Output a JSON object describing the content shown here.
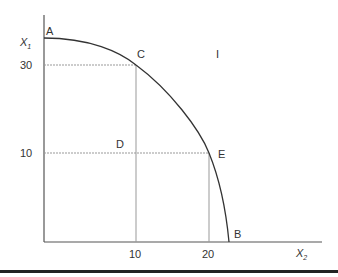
{
  "diagram": {
    "type": "production-possibility-frontier",
    "axes": {
      "y_label": "X",
      "y_label_sub": "1",
      "x_label": "X",
      "x_label_sub": "2",
      "y_ticks": [
        "30",
        "10"
      ],
      "x_ticks": [
        "10",
        "20"
      ]
    },
    "points": {
      "A": "A",
      "B": "B",
      "C": "C",
      "D": "D",
      "E": "E",
      "I": "I"
    },
    "colors": {
      "curve": "#333333",
      "axis": "#555555",
      "guide": "#888888",
      "rule": "#222222"
    }
  }
}
